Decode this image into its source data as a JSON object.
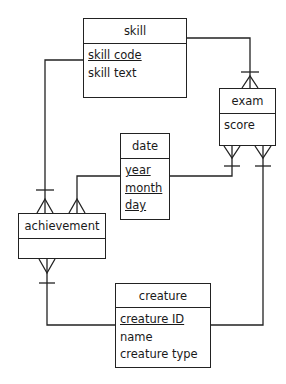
{
  "diagram": {
    "type": "entity-relationship",
    "notation": "crow's foot",
    "entities": [
      {
        "id": "skill",
        "name": "skill",
        "attributes": [
          {
            "name": "skill code",
            "primary_key": true
          },
          {
            "name": "skill text",
            "primary_key": false
          }
        ]
      },
      {
        "id": "exam",
        "name": "exam",
        "attributes": [
          {
            "name": "score",
            "primary_key": false
          }
        ]
      },
      {
        "id": "date",
        "name": "date",
        "attributes": [
          {
            "name": "year",
            "primary_key": true
          },
          {
            "name": "month",
            "primary_key": true
          },
          {
            "name": "day",
            "primary_key": true
          }
        ]
      },
      {
        "id": "achievement",
        "name": "achievement",
        "attributes": []
      },
      {
        "id": "creature",
        "name": "creature",
        "attributes": [
          {
            "name": "creature ID",
            "primary_key": true
          },
          {
            "name": "name",
            "primary_key": false
          },
          {
            "name": "creature type",
            "primary_key": false
          }
        ]
      }
    ],
    "relationships": [
      {
        "from": "skill",
        "to": "exam",
        "from_card": "one",
        "to_card": "many"
      },
      {
        "from": "skill",
        "to": "achievement",
        "from_card": "one",
        "to_card": "many"
      },
      {
        "from": "date",
        "to": "exam",
        "from_card": "one",
        "to_card": "many"
      },
      {
        "from": "date",
        "to": "achievement",
        "from_card": "one",
        "to_card": "many"
      },
      {
        "from": "creature",
        "to": "exam",
        "from_card": "one",
        "to_card": "many"
      },
      {
        "from": "creature",
        "to": "achievement",
        "from_card": "one",
        "to_card": "many"
      }
    ],
    "colors": {
      "line": "#222222",
      "background": "#ffffff"
    }
  },
  "skill": {
    "title": "skill",
    "attr0": "skill code",
    "attr1": "skill text"
  },
  "exam": {
    "title": "exam",
    "attr0": "score"
  },
  "date": {
    "title": "date",
    "attr0": "year",
    "attr1": "month",
    "attr2": "day"
  },
  "achievement": {
    "title": "achievement"
  },
  "creature": {
    "title": "creature",
    "attr0": "creature ID",
    "attr1": "name",
    "attr2": "creature type"
  }
}
